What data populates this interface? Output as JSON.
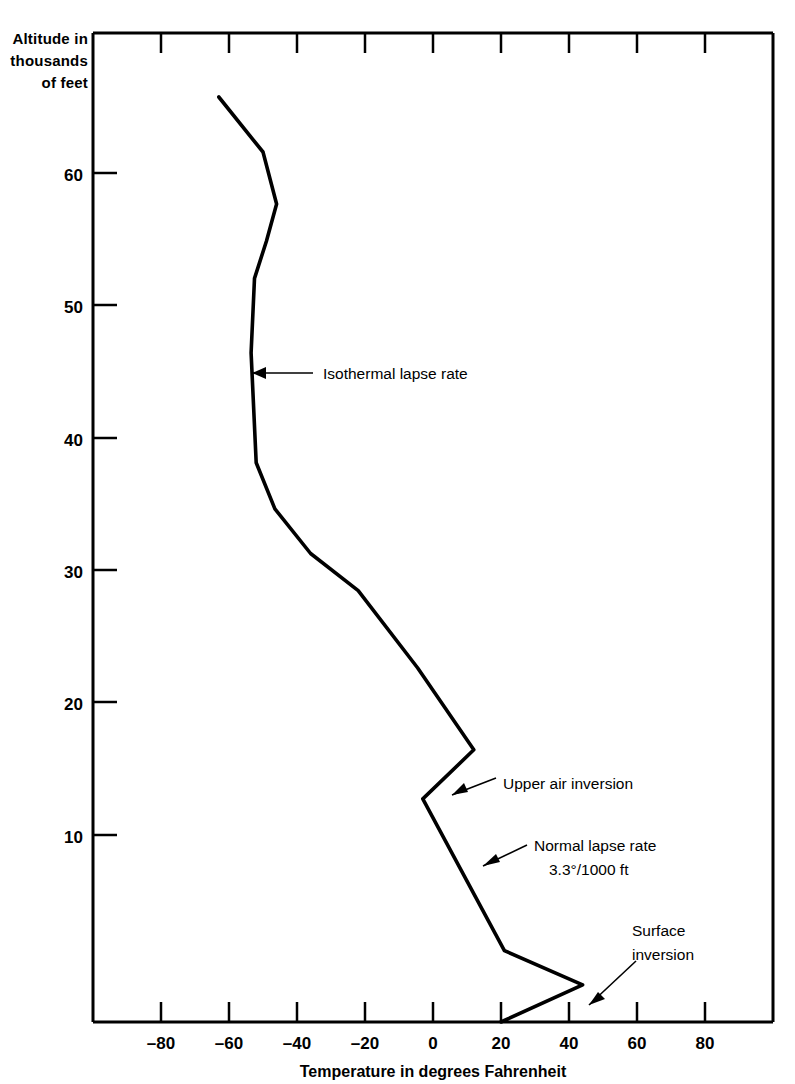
{
  "chart_data": {
    "type": "line",
    "title": "",
    "xlabel": "Temperature in degrees Fahrenheit",
    "ylabel_lines": [
      "Altitude in",
      "thousands",
      "of feet"
    ],
    "xlim": [
      -100,
      100
    ],
    "ylim": [
      0,
      66.5
    ],
    "xticks": [
      -80,
      -60,
      -40,
      -20,
      0,
      20,
      40,
      60,
      80
    ],
    "xticklabels": [
      "–80",
      "–60",
      "–40",
      "–20",
      "0",
      "20",
      "40",
      "60",
      "80"
    ],
    "yticks": [
      10,
      20,
      30,
      40,
      50,
      60
    ],
    "yticklabels": [
      "10",
      "20",
      "30",
      "40",
      "50",
      "60"
    ],
    "grid": false,
    "legend": false,
    "series": [
      {
        "name": "Temperature sounding",
        "x": [
          20.0,
          44.0,
          21.0,
          -3.0,
          12.0,
          -4.5,
          -22.0,
          -36.0,
          -46.5,
          -52.0,
          -53.5,
          -52.5,
          -49.0,
          -46.0,
          -50.0,
          -63.0
        ],
        "y": [
          0.0,
          2.5,
          4.8,
          15.0,
          18.3,
          23.8,
          29.0,
          31.5,
          34.5,
          37.6,
          45.0,
          50.0,
          52.5,
          55.0,
          58.5,
          62.2
        ]
      }
    ],
    "annotations": [
      {
        "id": "isothermal",
        "lines": [
          "Isothermal lapse rate"
        ],
        "text_x": 56.0,
        "text_y": 45.5,
        "point_x": -53.3,
        "point_y": 45.5
      },
      {
        "id": "upper-air-inversion",
        "lines": [
          "Upper air inversion"
        ],
        "text_x": 41.0,
        "text_y": 18.3,
        "point_x": 10.5,
        "point_y": 16.7
      },
      {
        "id": "normal-lapse-rate",
        "lines": [
          "Normal lapse rate",
          "3.3°/1000 ft"
        ],
        "text_x": 39.0,
        "text_y": 12.6,
        "point_x": 4.0,
        "point_y": 10.2
      },
      {
        "id": "surface-inversion",
        "lines": [
          "Surface",
          "inversion"
        ],
        "text_x": 55.0,
        "text_y": 7.2,
        "point_x": 42.5,
        "point_y": 1.3
      }
    ]
  }
}
